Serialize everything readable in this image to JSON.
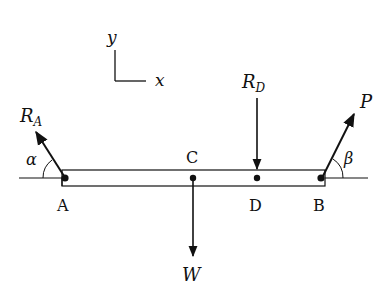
{
  "diagram": {
    "type": "free-body diagram of a beam",
    "axes": {
      "x_label": "x",
      "y_label": "y"
    },
    "points": [
      {
        "id": "A",
        "label": "A"
      },
      {
        "id": "C",
        "label": "C"
      },
      {
        "id": "D",
        "label": "D"
      },
      {
        "id": "B",
        "label": "B"
      }
    ],
    "forces": {
      "RA": {
        "label_main": "R",
        "label_sub": "A",
        "angle_label": "α"
      },
      "RD": {
        "label_main": "R",
        "label_sub": "D"
      },
      "W": {
        "label": "W"
      },
      "P": {
        "label": "P",
        "angle_label": "β"
      }
    },
    "colors": {
      "ink": "#111111",
      "background": "#ffffff"
    }
  }
}
